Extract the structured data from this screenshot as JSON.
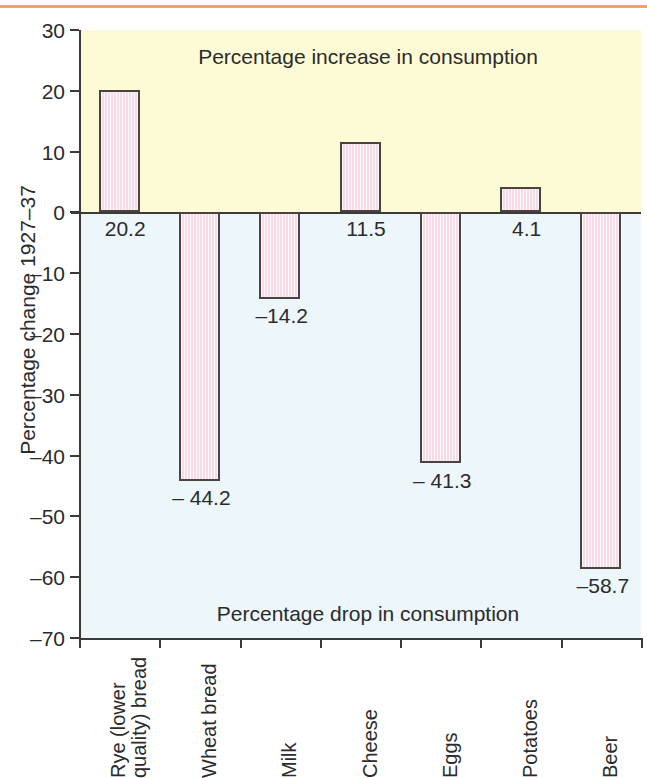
{
  "chart_data": {
    "type": "bar",
    "title": "",
    "subtitle": "",
    "xlabel": "",
    "ylabel": "Percentage change 1927–37",
    "ylim": [
      -70,
      30
    ],
    "ytick_step": 10,
    "grid": false,
    "legend": "none",
    "categories": [
      "Rye (lower quality) bread",
      "Wheat bread",
      "Milk",
      "Cheese",
      "Eggs",
      "Potatoes",
      "Beer"
    ],
    "category_lines": [
      [
        "Rye (lower",
        "quality) bread"
      ],
      [
        "Wheat bread"
      ],
      [
        "Milk"
      ],
      [
        "Cheese"
      ],
      [
        "Eggs"
      ],
      [
        "Potatoes"
      ],
      [
        "Beer"
      ]
    ],
    "values": [
      20.2,
      -44.2,
      -14.2,
      11.5,
      -41.3,
      4.1,
      -58.7
    ],
    "value_labels": [
      "20.2",
      "– 44.2",
      "–14.2",
      "11.5",
      "– 41.3",
      "4.1",
      "–58.7"
    ],
    "ytick_labels": [
      "30",
      "20",
      "10",
      "0",
      "–10",
      "–20",
      "–30",
      "–40",
      "–50",
      "–60",
      "–70"
    ],
    "ytick_values": [
      30,
      20,
      10,
      0,
      -10,
      -20,
      -30,
      -40,
      -50,
      -60,
      -70
    ],
    "annotations": [
      {
        "text": "Percentage increase in consumption",
        "region": "positive"
      },
      {
        "text": "Percentage drop in consumption",
        "region": "negative"
      }
    ],
    "colors": {
      "bar_fill": "#f8dbe6",
      "bar_border": "#4a4340",
      "positive_band": "#fdfbd5",
      "negative_band": "#edf6fa",
      "axis": "#3a3a38",
      "top_rule": "#eda759",
      "text": "#2b2b2b"
    }
  }
}
